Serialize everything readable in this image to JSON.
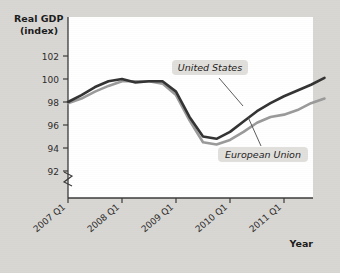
{
  "figure": {
    "background_color": "#d9d7d3",
    "plot_background_color": "#ffffff",
    "year_axis_label": "Year",
    "y_axis_title_line1": "Real GDP",
    "y_axis_title_line2": "(index)",
    "axis_break_symbol": "axis-break"
  },
  "chart_data": {
    "type": "line",
    "title": "",
    "subtitle": "",
    "xlabel": "Year",
    "ylabel": "Real GDP (index)",
    "ylim": [
      91,
      103
    ],
    "yticks": [
      92,
      94,
      96,
      98,
      100,
      102
    ],
    "ytick_labels": [
      "92",
      "94",
      "96",
      "98",
      "100",
      "102"
    ],
    "y_axis_broken": true,
    "grid": false,
    "legend_position": "inline-annotations",
    "xlabel_rotation_deg": -40,
    "x": [
      "2007 Q1",
      "2007 Q2",
      "2007 Q3",
      "2007 Q4",
      "2008 Q1",
      "2008 Q2",
      "2008 Q3",
      "2008 Q4",
      "2009 Q1",
      "2009 Q2",
      "2009 Q3",
      "2009 Q4",
      "2010 Q1",
      "2010 Q2",
      "2010 Q3",
      "2010 Q4",
      "2011 Q1",
      "2011 Q2",
      "2011 Q3",
      "2011 Q4"
    ],
    "xticks": [
      "2007 Q1",
      "2008 Q1",
      "2009 Q1",
      "2010 Q1",
      "2011 Q1"
    ],
    "series": [
      {
        "name": "United States",
        "color": "#333333",
        "values": [
          98.0,
          98.6,
          99.3,
          99.8,
          100.0,
          99.7,
          99.8,
          99.8,
          98.9,
          96.7,
          95.0,
          94.8,
          95.4,
          96.3,
          97.2,
          97.9,
          98.5,
          99.0,
          99.5,
          100.1
        ]
      },
      {
        "name": "European Union",
        "color": "#9a9a9a",
        "values": [
          97.9,
          98.3,
          98.9,
          99.4,
          99.8,
          99.8,
          99.8,
          99.6,
          98.6,
          96.4,
          94.5,
          94.3,
          94.7,
          95.4,
          96.2,
          96.7,
          96.9,
          97.3,
          97.9,
          98.3
        ]
      }
    ],
    "annotations": [
      {
        "text": "United States",
        "target_series": "United States"
      },
      {
        "text": "European Union",
        "target_series": "European Union"
      }
    ]
  }
}
